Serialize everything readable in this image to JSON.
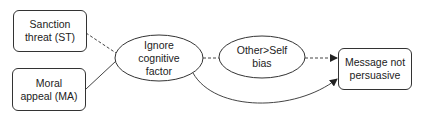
{
  "diagram": {
    "nodes": {
      "sanction_threat": {
        "label": "Sanction threat (ST)",
        "line1": "Sanction",
        "line2": "threat (ST)",
        "shape": "rounded-rect"
      },
      "moral_appeal": {
        "label": "Moral appeal (MA)",
        "line1": "Moral",
        "line2": "appeal (MA)",
        "shape": "rounded-rect"
      },
      "ignore_cognitive": {
        "label": "Ignore cognitive factor",
        "line1": "Ignore",
        "line2": "cognitive",
        "line3": "factor",
        "shape": "ellipse"
      },
      "other_self_bias": {
        "label": "Other>Self bias",
        "line1": "Other>Self",
        "line2": "bias",
        "shape": "ellipse"
      },
      "message_not_persuasive": {
        "label": "Message not persuasive",
        "line1": "Message not",
        "line2": "persuasive",
        "shape": "rounded-rect"
      }
    },
    "edges": [
      {
        "from": "sanction_threat",
        "to": "ignore_cognitive",
        "style": "dashed",
        "arrow": false
      },
      {
        "from": "moral_appeal",
        "to": "ignore_cognitive",
        "style": "solid",
        "arrow": false
      },
      {
        "from": "ignore_cognitive",
        "to": "other_self_bias",
        "style": "dashed",
        "arrow": false
      },
      {
        "from": "other_self_bias",
        "to": "message_not_persuasive",
        "style": "dashed",
        "arrow": true
      },
      {
        "from": "ignore_cognitive",
        "to": "message_not_persuasive",
        "style": "solid-curved",
        "arrow": true
      }
    ],
    "colors": {
      "stroke": "#333333",
      "text": "#222222",
      "background": "#ffffff"
    }
  }
}
